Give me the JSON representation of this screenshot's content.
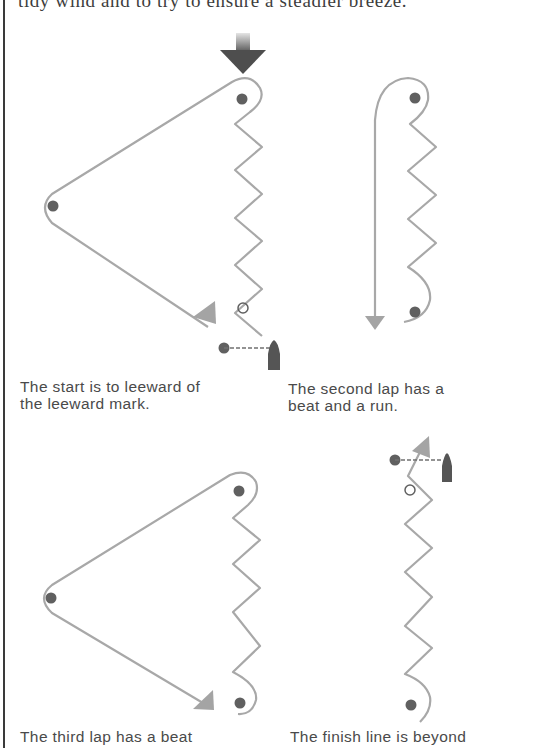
{
  "page": {
    "top_text": "tidy wind and to try to ensure a steadier breeze."
  },
  "colors": {
    "course_line": "#a8a8a8",
    "mark": "#606060",
    "arrow_head": "#a4a4a4",
    "wind_arrow": "#4e4e4e",
    "boat": "#555555"
  },
  "diagrams": [
    {
      "id": "start",
      "caption": {
        "line1": "The start is to leeward of",
        "line2": "the leeward mark."
      }
    },
    {
      "id": "second-lap",
      "caption": {
        "line1": "The second lap has a",
        "line2": "beat and a run."
      }
    },
    {
      "id": "third-lap",
      "caption": {
        "line1": "The third lap has a beat",
        "line2": ""
      }
    },
    {
      "id": "finish",
      "caption": {
        "line1": "The finish line is beyond",
        "line2": ""
      }
    }
  ],
  "legend_icons": [
    "wind-direction-arrow",
    "windward-mark",
    "wing-mark",
    "leeward-mark",
    "start-line-buoy",
    "committee-boat",
    "course-direction-arrow"
  ]
}
